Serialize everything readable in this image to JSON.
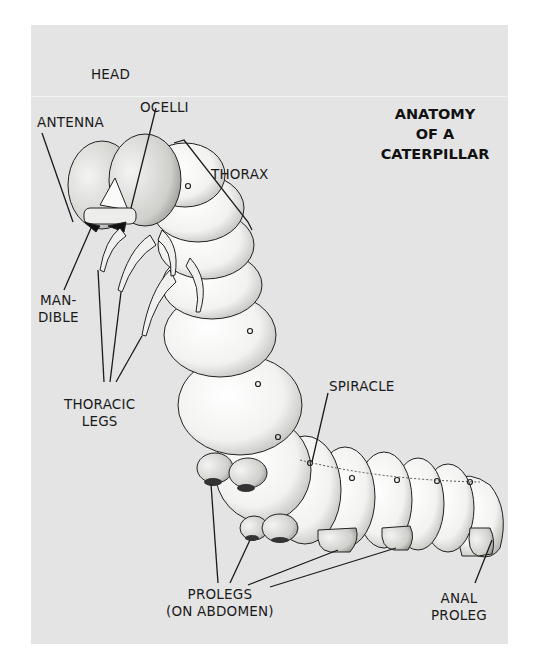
{
  "diagram": {
    "title_lines": [
      "ANATOMY",
      "OF A",
      "CATERPILLAR"
    ],
    "labels": {
      "head": "HEAD",
      "antenna": "ANTENNA",
      "ocelli": "OCELLI",
      "thorax": "THORAX",
      "mandible": [
        "MAN-",
        "DIBLE"
      ],
      "thoracic_legs": [
        "THORACIC",
        "LEGS"
      ],
      "spiracle": "SPIRACLE",
      "prolegs": [
        "PROLEGS",
        "(ON ABDOMEN)"
      ],
      "anal_proleg": [
        "ANAL",
        "PROLEG"
      ]
    },
    "colors": {
      "background": "#e4e4e4",
      "ink": "#1a1a1a",
      "body": "#f6f6f4"
    }
  }
}
